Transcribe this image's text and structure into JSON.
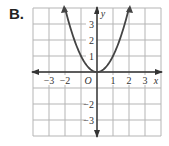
{
  "problem_label": "B.",
  "chart_data": {
    "type": "line",
    "title": "",
    "function": "y = x^2",
    "xlabel": "x",
    "ylabel": "y",
    "origin_label": "O",
    "xlim": [
      -4,
      4
    ],
    "ylim": [
      -4,
      4
    ],
    "grid": true,
    "x_ticks": [
      -3,
      -2,
      1,
      2,
      3
    ],
    "x_tick_labels": [
      "−3",
      "−2",
      "1",
      "2",
      "3"
    ],
    "y_ticks": [
      3,
      2,
      1,
      -2,
      -3
    ],
    "y_tick_labels": [
      "3",
      "2",
      "1",
      "−2",
      "−3"
    ],
    "series": [
      {
        "name": "parabola",
        "x": [
          -2,
          -1.5,
          -1,
          -0.5,
          0,
          0.5,
          1,
          1.5,
          2
        ],
        "y": [
          4,
          2.25,
          1,
          0.25,
          0,
          0.25,
          1,
          2.25,
          4
        ]
      }
    ],
    "colors": {
      "grid": "#b5b5b5",
      "axis": "#333333",
      "curve": "#444444"
    }
  }
}
